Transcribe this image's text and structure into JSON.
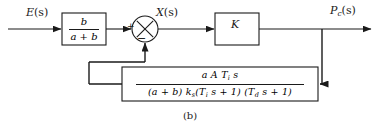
{
  "figure": {
    "caption": "(b)",
    "signals": {
      "input": {
        "base": "E",
        "arg": "(s)"
      },
      "mid": {
        "base": "X",
        "arg": "(s)"
      },
      "output": {
        "base": "P",
        "sub": "c",
        "arg": "(s)"
      }
    },
    "blocks": {
      "input_gain": {
        "numerator": "b",
        "denominator": "a + b"
      },
      "forward_gain": {
        "label": "K"
      },
      "feedback": {
        "numerator": {
          "text": "a A T",
          "sub": "i",
          "tail": " s"
        },
        "denominator": {
          "part1": "(a + b) k",
          "sub1": "s",
          "part2": "(T",
          "sub2": "i",
          "part3": " s + 1) (T",
          "sub3": "d",
          "part4": " s + 1)"
        }
      }
    },
    "summing_junction": {
      "sign_input": "+",
      "sign_feedback": "−"
    },
    "colors": {
      "line": "#1a1a1a",
      "text": "#1a1a1a",
      "background": "#ffffff"
    }
  }
}
